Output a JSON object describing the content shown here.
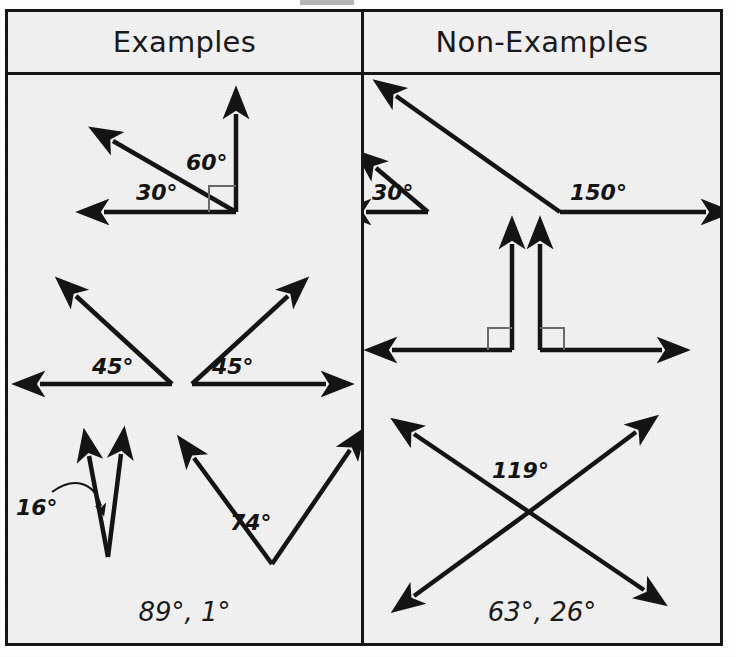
{
  "table": {
    "columns": [
      {
        "id": "examples",
        "header": "Examples",
        "footer": "89°, 1°"
      },
      {
        "id": "non-examples",
        "header": "Non-Examples",
        "footer": "63°, 26°"
      }
    ]
  },
  "examples": {
    "row1": {
      "name": "adjacent-angles-30-60",
      "labels": {
        "left": "30°",
        "right": "60°"
      },
      "right_angle_marker": true
    },
    "row2": {
      "name": "two-45-degree-angles",
      "labels": {
        "left": "45°",
        "right": "45°"
      }
    },
    "row3": {
      "name": "narrow-16-and-74",
      "labels": {
        "left": "16°",
        "right": "74°"
      },
      "leader_line": true
    }
  },
  "non_examples": {
    "row1": {
      "name": "separate-30-and-150",
      "labels": {
        "left": "30°",
        "right": "150°"
      }
    },
    "row2": {
      "name": "two-separated-right-angles",
      "labels": {},
      "right_angle_markers": 2
    },
    "row3": {
      "name": "crossing-lines-119",
      "labels": {
        "center": "119°"
      }
    }
  },
  "colors": {
    "ink": "#141414",
    "border": "#161616",
    "paper": "#f1f1f1",
    "marker_stroke": "#5a5a5a"
  }
}
